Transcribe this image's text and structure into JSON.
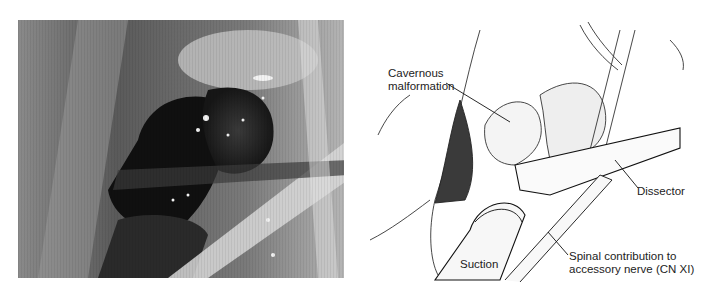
{
  "figure": {
    "left_panel": {
      "type": "intraoperative-photograph",
      "tone": "grayscale"
    },
    "right_panel": {
      "type": "surgical-illustration",
      "labels": {
        "cavernous_line1": "Cavernous",
        "cavernous_line2": "malformation",
        "dissector": "Dissector",
        "suction": "Suction",
        "nerve_line1": "Spinal contribution to",
        "nerve_line2": "accessory nerve (CN XI)"
      }
    }
  },
  "colors": {
    "background": "#ffffff",
    "ink": "#222222",
    "photo_dark": "#111111",
    "photo_mid": "#6a6a6a"
  }
}
